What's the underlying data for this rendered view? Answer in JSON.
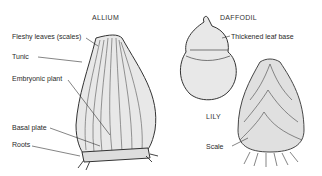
{
  "diagram": {
    "bulbs": [
      {
        "name": "ALLIUM",
        "labels": [
          "Fleshy leaves (scales)",
          "Tunic",
          "Embryonic plant",
          "Basal plate",
          "Roots"
        ]
      },
      {
        "name": "DAFFODIL",
        "labels": [
          "Thickened leaf base"
        ]
      },
      {
        "name": "LILY",
        "labels": [
          "Scale"
        ]
      }
    ]
  }
}
